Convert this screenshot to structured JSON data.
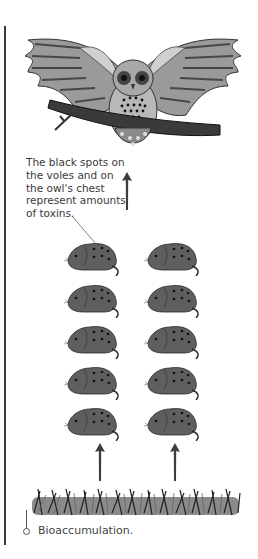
{
  "figure": {
    "caption": "Bioaccumulation.",
    "annotation": "The black spots on the voles and on the owl's chest represent amounts of toxins.",
    "levels": [
      {
        "name": "owl",
        "role": "top predator",
        "count": 1
      },
      {
        "name": "voles",
        "role": "primary consumers",
        "count": 10,
        "columns": 2,
        "rows": 5
      },
      {
        "name": "grass",
        "role": "producer",
        "count": 1
      }
    ],
    "arrows": [
      {
        "from": "voles",
        "to": "owl"
      },
      {
        "from": "grass",
        "to": "voles-left-column"
      },
      {
        "from": "grass",
        "to": "voles-right-column"
      }
    ],
    "colors": {
      "vole_fill": "#5f5f5f",
      "toxin_spot": "#111111",
      "arrow": "#3d3d3d",
      "text": "#3a3a3a"
    }
  }
}
